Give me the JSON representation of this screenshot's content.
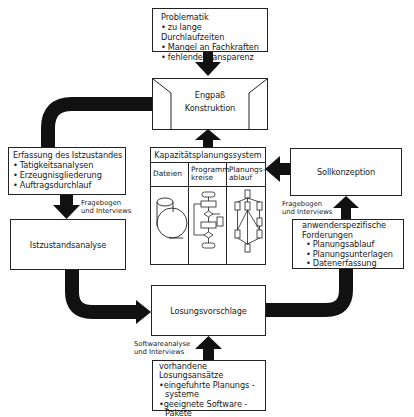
{
  "problematik": {
    "title": "Problematik",
    "items": [
      "zu lange Durchlaufzeiten",
      "Mangel an Fachkraften",
      "fehlende Transparenz"
    ]
  },
  "engpass": {
    "line1": "Engpaß",
    "line2": "Konstruktion"
  },
  "erfassung": {
    "title": "Erfassung des Istzustandes",
    "items": [
      "Tatigkeitsanalysen",
      "Erzeugnisgliederung",
      "Auftragsdurchlauf"
    ]
  },
  "label_left": {
    "line1": "Fragebogen",
    "line2": "und Interviews"
  },
  "istzustand": {
    "label": "Istzustandsanalyse"
  },
  "kapazitaet": {
    "title": "Kapazitätsplanungssystem",
    "columns": [
      {
        "line1": "Dateien",
        "line2": "",
        "icon": "database-cylinder-icon"
      },
      {
        "line1": "Programm",
        "line2": "kreise",
        "icon": "flowchart-icon"
      },
      {
        "line1": "Planungs-",
        "line2": "ablauf",
        "icon": "network-plan-icon"
      }
    ]
  },
  "sollkonzeption": {
    "label": "Sollkonzeption"
  },
  "label_right": {
    "line1": "Fragebogen",
    "line2": "und Interviews"
  },
  "anwender": {
    "title1": "anwenderspezifische",
    "title2": "Forderungen",
    "items": [
      "Planungsablauf",
      "Planungsunterlagen",
      "Datenerfassung"
    ]
  },
  "loesung": {
    "label": "Losungsvorschlage"
  },
  "label_bottom": {
    "line1": "Softwareanalyse",
    "line2": "und Interviews"
  },
  "vorhandene": {
    "title": "vorhandene Losungsansätze",
    "item1_line1": "eingefuhrte Planungs -",
    "item1_line2": "systeme",
    "item2_line1": "geeignete Software -",
    "item2_line2": "Pakete"
  }
}
